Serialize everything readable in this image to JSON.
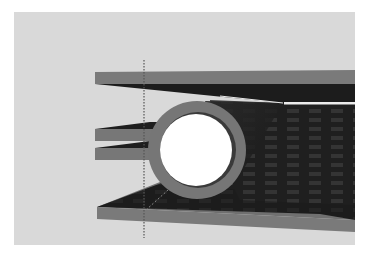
{
  "figure": {
    "colors": {
      "page_bg": "#ffffff",
      "canvas_bg": "#d9d9d9",
      "plate_edge": "#7a7a7a",
      "plate_surface": "#1e1e1e",
      "plate_grid": "#3a3a3a",
      "tube_ring": "#767676",
      "tube_inner": "#ffffff",
      "dotted_line": "#555555",
      "highlight": "#e8e8e8"
    },
    "canvas": {
      "x": 14,
      "y": 12,
      "width": 341,
      "height": 233
    },
    "tube": {
      "cx": 197,
      "cy": 150,
      "outer_r": 49,
      "inner_r": 37
    },
    "top_plate": {
      "edge_y": 72,
      "edge_h": 12,
      "left_x": 95
    },
    "bottom_plate": {
      "edge_y": 207,
      "edge_h": 12,
      "left_x": 97
    },
    "fins": [
      {
        "y": 129,
        "h": 12,
        "left_x": 95
      },
      {
        "y": 148,
        "h": 12,
        "left_x": 95
      }
    ],
    "dotted_line": {
      "x": 144,
      "y1": 60,
      "y2": 238
    }
  }
}
